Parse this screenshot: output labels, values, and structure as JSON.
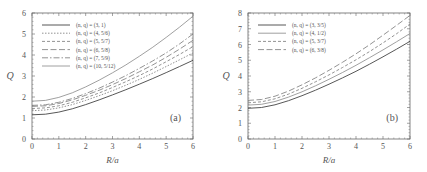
{
  "chart_data": [
    {
      "type": "line",
      "panel_label": "(a)",
      "xlabel": "R/a",
      "ylabel": "Q",
      "xlim": [
        0,
        6
      ],
      "ylim": [
        0,
        6
      ],
      "xticks": [
        0,
        1,
        2,
        3,
        4,
        5,
        6
      ],
      "yticks": [
        0,
        1,
        2,
        3,
        4,
        5,
        6
      ],
      "grid": false,
      "legend_position": "upper left",
      "x": [
        0,
        0.5,
        1,
        1.5,
        2,
        2.5,
        3,
        3.5,
        4,
        4.5,
        5,
        5.5,
        6
      ],
      "series": [
        {
          "name": "(n, q) = (3, 1)",
          "style": "solid",
          "values": [
            1.15,
            1.18,
            1.28,
            1.44,
            1.64,
            1.86,
            2.1,
            2.35,
            2.61,
            2.88,
            3.16,
            3.45,
            3.75
          ]
        },
        {
          "name": "(n, q) = (4, 5/6)",
          "style": "dotted",
          "values": [
            1.35,
            1.38,
            1.48,
            1.64,
            1.84,
            2.06,
            2.3,
            2.56,
            2.84,
            3.14,
            3.45,
            3.77,
            4.1
          ]
        },
        {
          "name": "(n, q) = (5, 5/7)",
          "style": "short-dash",
          "values": [
            1.45,
            1.48,
            1.58,
            1.75,
            1.96,
            2.19,
            2.45,
            2.73,
            3.02,
            3.34,
            3.68,
            4.03,
            4.4
          ]
        },
        {
          "name": "(n, q) = (6, 5/8)",
          "style": "long-dash",
          "values": [
            1.55,
            1.58,
            1.69,
            1.86,
            2.08,
            2.32,
            2.59,
            2.88,
            3.2,
            3.53,
            3.89,
            4.28,
            4.7
          ]
        },
        {
          "name": "(n, q) = (7, 5/9)",
          "style": "dash-dot",
          "values": [
            1.6,
            1.63,
            1.75,
            1.93,
            2.16,
            2.42,
            2.71,
            3.02,
            3.36,
            3.72,
            4.1,
            4.53,
            5.0
          ]
        },
        {
          "name": "(n, q) = (10, 5/12)",
          "style": "solid-light",
          "values": [
            1.8,
            1.84,
            1.98,
            2.2,
            2.48,
            2.8,
            3.15,
            3.53,
            3.94,
            4.37,
            4.84,
            5.33,
            5.85
          ]
        }
      ]
    },
    {
      "type": "line",
      "panel_label": "(b)",
      "xlabel": "R/a",
      "ylabel": "Q",
      "xlim": [
        0,
        6
      ],
      "ylim": [
        0,
        8
      ],
      "xticks": [
        0,
        1,
        2,
        3,
        4,
        5,
        6
      ],
      "yticks": [
        0,
        1,
        2,
        3,
        4,
        5,
        6,
        7,
        8
      ],
      "grid": false,
      "legend_position": "upper left",
      "x": [
        0,
        0.5,
        1,
        1.5,
        2,
        2.5,
        3,
        3.5,
        4,
        4.5,
        5,
        5.5,
        6
      ],
      "series": [
        {
          "name": "(n, q) = (3, 3/5)",
          "style": "solid",
          "values": [
            1.95,
            2.0,
            2.17,
            2.43,
            2.75,
            3.1,
            3.48,
            3.88,
            4.3,
            4.75,
            5.22,
            5.7,
            6.2
          ]
        },
        {
          "name": "(n, q) = (4, 1/2)",
          "style": "solid-light",
          "values": [
            2.15,
            2.2,
            2.38,
            2.66,
            3.0,
            3.38,
            3.79,
            4.22,
            4.68,
            5.16,
            5.66,
            6.17,
            6.7
          ]
        },
        {
          "name": "(n, q) = (5, 3/7)",
          "style": "short-dash",
          "values": [
            2.3,
            2.36,
            2.55,
            2.85,
            3.22,
            3.63,
            4.07,
            4.54,
            5.03,
            5.55,
            6.1,
            6.68,
            7.3
          ]
        },
        {
          "name": "(n, q) = (6, 3/8)",
          "style": "long-dash",
          "values": [
            2.45,
            2.51,
            2.72,
            3.04,
            3.44,
            3.88,
            4.36,
            4.87,
            5.41,
            5.98,
            6.59,
            7.21,
            7.85
          ]
        }
      ]
    }
  ]
}
